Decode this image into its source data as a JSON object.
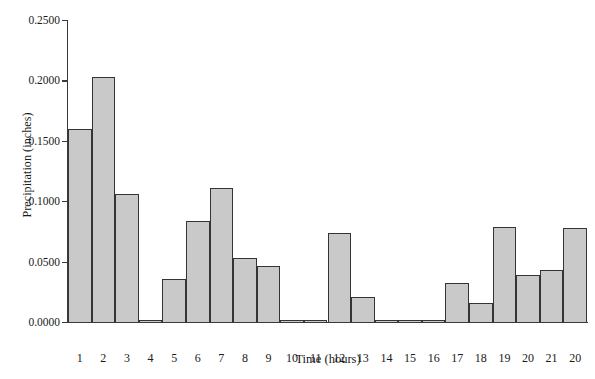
{
  "chart_data": {
    "type": "bar",
    "title": "",
    "subtitle": "",
    "xlabel": "Time (hours)",
    "ylabel": "Precipitation (inches)",
    "categories": [
      "1",
      "2",
      "3",
      "4",
      "5",
      "6",
      "7",
      "8",
      "9",
      "10",
      "11",
      "12",
      "13",
      "14",
      "15",
      "16",
      "17",
      "18",
      "19",
      "20",
      "21",
      "20"
    ],
    "values": [
      0.16,
      0.203,
      0.106,
      0.001,
      0.036,
      0.084,
      0.111,
      0.053,
      0.046,
      0.0005,
      0.002,
      0.074,
      0.021,
      0.0,
      0.0,
      0.001,
      0.032,
      0.016,
      0.079,
      0.039,
      0.043,
      0.078
    ],
    "ylim": [
      0.0,
      0.25
    ],
    "ytick_values": [
      0.0,
      0.05,
      0.1,
      0.15,
      0.2,
      0.25
    ],
    "ytick_labels": [
      "0.0000",
      "0.0500",
      "0.1000",
      "0.1500",
      "0.2000",
      "0.2500"
    ],
    "grid": false,
    "legend": null,
    "legend_position": "none",
    "bar_fill_color": "#c9c9c9",
    "bar_edge_color": "#343434",
    "axis_color": "#3a3a3a",
    "background_color": "#ffffff"
  }
}
